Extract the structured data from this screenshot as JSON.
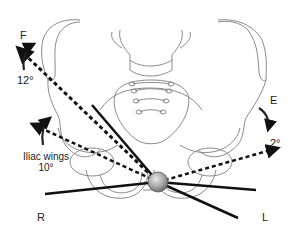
{
  "diagram": {
    "labels": {
      "flexion": "F",
      "flexion_angle": "12°",
      "extension": "E",
      "extension_angle": "2°",
      "iliac_wings_line1": "Iliac wings",
      "iliac_wings_line2": "10°",
      "right": "R",
      "left": "L"
    },
    "colors": {
      "outline": "#8a8a8a",
      "axis": "#111111",
      "ball": "#9a9a9a",
      "background": "#ffffff"
    }
  }
}
